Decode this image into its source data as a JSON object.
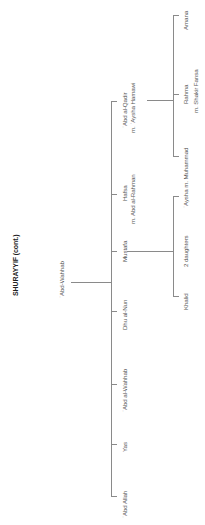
{
  "title": "SHURAYYIF (cont.)",
  "root": {
    "name": "ʿAbd-Wahhab"
  },
  "children": [
    {
      "name": "ʿAbd Allah"
    },
    {
      "name": "Yas"
    },
    {
      "name": "ʿAbd al-Wahhab"
    },
    {
      "name": "Dhu al-Nun"
    },
    {
      "name": "Mustafa",
      "children": [
        {
          "name": "Khalid"
        },
        {
          "name": "2 daughters"
        },
        {
          "name": "ʿAysha m. Muhammad"
        }
      ]
    },
    {
      "name": "Hafsa",
      "spouse": "m. Abd al-Rahman"
    },
    {
      "name": "ʿAbd al-Qadir",
      "spouse": "m. ʿAysha Hamawi",
      "children": [
        {
          "name": "Rahma",
          "spouse": "m. Shakir Fansa"
        },
        {
          "name": "Amana"
        }
      ]
    }
  ],
  "colors": {
    "lines": "#8a8a8a",
    "text": "#555555",
    "title": "#222222"
  }
}
